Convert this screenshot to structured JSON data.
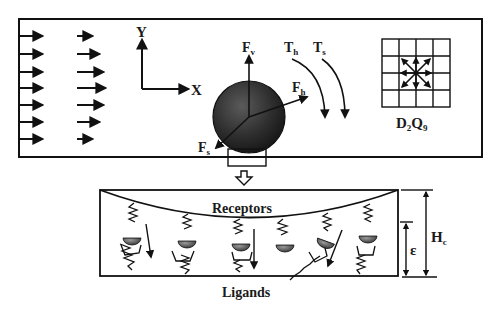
{
  "figure": {
    "axes": {
      "x_label": "X",
      "y_label": "Y"
    },
    "forces": {
      "vertical": {
        "main": "F",
        "sub": "v"
      },
      "horizontal": {
        "main": "F",
        "sub": "h"
      },
      "shear": {
        "main": "F",
        "sub": "s"
      }
    },
    "torques": {
      "hydrodynamic": {
        "main": "T",
        "sub": "h"
      },
      "shear": {
        "main": "T",
        "sub": "s"
      }
    },
    "lattice": {
      "label_d": "D",
      "label_d_sub": "2",
      "label_q": "Q",
      "label_q_sub": "9"
    },
    "inset": {
      "top_label": "Receptors",
      "bottom_label": "Ligands",
      "gap_label": "ε",
      "height_main": "H",
      "height_sub": "c"
    },
    "colors": {
      "line": "#111111",
      "sphere_dark": "#1e1e1e",
      "sphere_light": "#5a5a5a"
    }
  }
}
